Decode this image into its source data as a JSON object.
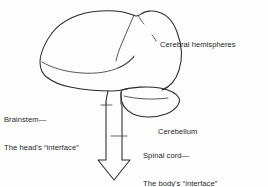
{
  "figure": {
    "background_color": "#fdfdfd",
    "ink_color": "#2b2b2b",
    "width": 268,
    "height": 187
  },
  "labels": {
    "cerebral_hemispheres": {
      "line1": "Cerebral hemispheres"
    },
    "brainstem": {
      "line1": "Brainstem—",
      "line2": "The head's “interface”"
    },
    "cerebellum": {
      "line1": "Cerebellum"
    },
    "spinal_cord": {
      "line1": "Spinal cord—",
      "line2": "The body's “interface”"
    }
  },
  "parts": {
    "cerebrum": "cerebrum-outline",
    "frontal_lobe": "frontal-lobe-fissure",
    "temporal_lobe": "temporal-lobe-outline",
    "lateral_fissure": "lateral-fissure-line",
    "central_sulcus": "central-sulcus-line",
    "cerebellum": "cerebellum-outline",
    "brainstem": "brainstem-outline",
    "spinal_cord_arrow": "spinal-cord-arrow"
  }
}
